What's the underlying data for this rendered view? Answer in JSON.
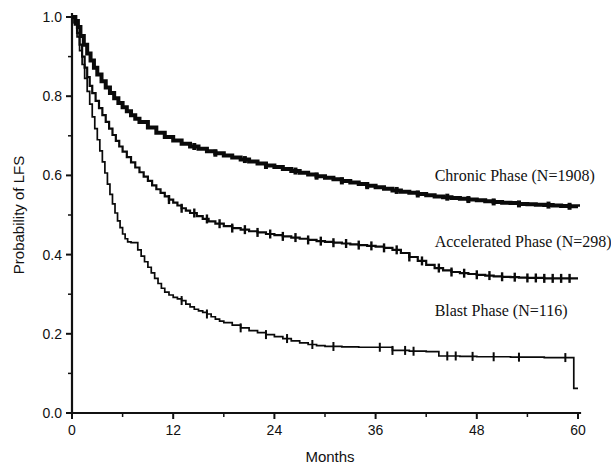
{
  "chart_data": {
    "type": "line",
    "title": "",
    "xlabel": "Months",
    "ylabel": "Probability of LFS",
    "xlim": [
      0,
      60
    ],
    "ylim": [
      0.0,
      1.0
    ],
    "grid": false,
    "legend_position": "inline-right",
    "x_ticks": [
      0,
      12,
      24,
      36,
      48,
      60
    ],
    "x_tick_labels": [
      "0",
      "12",
      "24",
      "36",
      "48",
      "60"
    ],
    "x_minor_ticks": [
      6,
      18,
      30,
      42,
      54
    ],
    "y_ticks": [
      0.0,
      0.2,
      0.4,
      0.6,
      0.8,
      1.0
    ],
    "y_tick_labels": [
      "0.0",
      "0.2",
      "0.4",
      "0.6",
      "0.8",
      "1.0"
    ],
    "y_minor_ticks": [
      0.1,
      0.3,
      0.5,
      0.7,
      0.9
    ],
    "series": [
      {
        "name": "Chronic Phase (N=1908)",
        "label": "Chronic Phase (N=1908)",
        "n": 1908,
        "color": "#0a0a0a",
        "line_width": 4.0,
        "label_x": 43.0,
        "label_y": 0.585,
        "points": [
          [
            0.0,
            1.0
          ],
          [
            0.4,
            0.99
          ],
          [
            0.7,
            0.975
          ],
          [
            1.0,
            0.952
          ],
          [
            1.4,
            0.93
          ],
          [
            1.8,
            0.908
          ],
          [
            2.2,
            0.89
          ],
          [
            2.6,
            0.872
          ],
          [
            3.0,
            0.855
          ],
          [
            3.5,
            0.838
          ],
          [
            4.0,
            0.822
          ],
          [
            4.5,
            0.808
          ],
          [
            5.0,
            0.795
          ],
          [
            5.5,
            0.783
          ],
          [
            6.0,
            0.772
          ],
          [
            6.5,
            0.762
          ],
          [
            7.0,
            0.752
          ],
          [
            7.5,
            0.743
          ],
          [
            8.0,
            0.735
          ],
          [
            9.0,
            0.721
          ],
          [
            10.0,
            0.708
          ],
          [
            11.0,
            0.697
          ],
          [
            12.0,
            0.688
          ],
          [
            13.0,
            0.68
          ],
          [
            14.0,
            0.673
          ],
          [
            15.0,
            0.667
          ],
          [
            16.0,
            0.661
          ],
          [
            17.0,
            0.656
          ],
          [
            18.0,
            0.65
          ],
          [
            19.0,
            0.645
          ],
          [
            20.0,
            0.64
          ],
          [
            21.0,
            0.635
          ],
          [
            22.0,
            0.63
          ],
          [
            23.0,
            0.625
          ],
          [
            24.0,
            0.621
          ],
          [
            25.0,
            0.616
          ],
          [
            26.0,
            0.611
          ],
          [
            27.0,
            0.607
          ],
          [
            28.0,
            0.602
          ],
          [
            29.0,
            0.598
          ],
          [
            30.0,
            0.594
          ],
          [
            31.0,
            0.59
          ],
          [
            32.0,
            0.586
          ],
          [
            33.0,
            0.582
          ],
          [
            34.0,
            0.578
          ],
          [
            35.0,
            0.574
          ],
          [
            36.0,
            0.57
          ],
          [
            37.0,
            0.566
          ],
          [
            38.0,
            0.562
          ],
          [
            39.0,
            0.559
          ],
          [
            40.0,
            0.556
          ],
          [
            41.0,
            0.553
          ],
          [
            42.0,
            0.55
          ],
          [
            43.0,
            0.547
          ],
          [
            44.0,
            0.545
          ],
          [
            45.0,
            0.543
          ],
          [
            46.0,
            0.541
          ],
          [
            47.0,
            0.539
          ],
          [
            48.0,
            0.537
          ],
          [
            49.0,
            0.535
          ],
          [
            50.0,
            0.533
          ],
          [
            51.0,
            0.531
          ],
          [
            52.0,
            0.53
          ],
          [
            53.0,
            0.528
          ],
          [
            54.0,
            0.527
          ],
          [
            55.0,
            0.526
          ],
          [
            56.0,
            0.525
          ],
          [
            57.0,
            0.524
          ],
          [
            58.0,
            0.523
          ],
          [
            59.0,
            0.522
          ],
          [
            60.0,
            0.521
          ]
        ],
        "censor_times": [
          14.5,
          17.0,
          20.5,
          23.0,
          26.5,
          29.0,
          32.0,
          35.0,
          38.5,
          41.0,
          44.5,
          47.0,
          50.0,
          53.0,
          56.5,
          59.0
        ]
      },
      {
        "name": "Accelerated Phase (N=298)",
        "label": "Accelerated Phase (N=298)",
        "n": 298,
        "color": "#0a0a0a",
        "line_width": 2.2,
        "label_x": 43.0,
        "label_y": 0.42,
        "points": [
          [
            0.0,
            1.0
          ],
          [
            0.3,
            0.985
          ],
          [
            0.6,
            0.96
          ],
          [
            0.9,
            0.93
          ],
          [
            1.2,
            0.9
          ],
          [
            1.5,
            0.872
          ],
          [
            1.8,
            0.848
          ],
          [
            2.1,
            0.826
          ],
          [
            2.4,
            0.808
          ],
          [
            2.8,
            0.788
          ],
          [
            3.2,
            0.77
          ],
          [
            3.6,
            0.752
          ],
          [
            4.0,
            0.735
          ],
          [
            4.4,
            0.718
          ],
          [
            4.8,
            0.702
          ],
          [
            5.2,
            0.687
          ],
          [
            5.6,
            0.673
          ],
          [
            6.0,
            0.66
          ],
          [
            6.5,
            0.646
          ],
          [
            7.0,
            0.633
          ],
          [
            7.5,
            0.62
          ],
          [
            8.0,
            0.608
          ],
          [
            8.5,
            0.597
          ],
          [
            9.0,
            0.586
          ],
          [
            9.5,
            0.575
          ],
          [
            10.0,
            0.565
          ],
          [
            10.5,
            0.556
          ],
          [
            11.0,
            0.547
          ],
          [
            11.5,
            0.539
          ],
          [
            12.0,
            0.531
          ],
          [
            12.5,
            0.524
          ],
          [
            13.0,
            0.517
          ],
          [
            13.5,
            0.511
          ],
          [
            14.0,
            0.505
          ],
          [
            14.8,
            0.497
          ],
          [
            15.5,
            0.49
          ],
          [
            16.2,
            0.484
          ],
          [
            17.0,
            0.478
          ],
          [
            18.0,
            0.472
          ],
          [
            19.0,
            0.467
          ],
          [
            20.0,
            0.463
          ],
          [
            21.0,
            0.459
          ],
          [
            22.0,
            0.456
          ],
          [
            23.0,
            0.452
          ],
          [
            24.0,
            0.449
          ],
          [
            25.0,
            0.446
          ],
          [
            26.0,
            0.443
          ],
          [
            27.0,
            0.44
          ],
          [
            28.0,
            0.437
          ],
          [
            29.0,
            0.434
          ],
          [
            30.0,
            0.432
          ],
          [
            31.0,
            0.43
          ],
          [
            32.0,
            0.428
          ],
          [
            33.0,
            0.426
          ],
          [
            34.0,
            0.424
          ],
          [
            35.0,
            0.422
          ],
          [
            36.0,
            0.42
          ],
          [
            37.0,
            0.417
          ],
          [
            38.0,
            0.412
          ],
          [
            39.0,
            0.404
          ],
          [
            40.0,
            0.394
          ],
          [
            41.0,
            0.384
          ],
          [
            42.0,
            0.374
          ],
          [
            43.0,
            0.366
          ],
          [
            44.0,
            0.36
          ],
          [
            45.0,
            0.356
          ],
          [
            46.0,
            0.353
          ],
          [
            47.0,
            0.351
          ],
          [
            48.0,
            0.349
          ],
          [
            49.0,
            0.347
          ],
          [
            50.0,
            0.345
          ],
          [
            51.0,
            0.344
          ],
          [
            52.0,
            0.343
          ],
          [
            53.0,
            0.342
          ],
          [
            54.0,
            0.341
          ],
          [
            55.0,
            0.341
          ],
          [
            56.0,
            0.34
          ],
          [
            57.0,
            0.34
          ],
          [
            58.0,
            0.34
          ],
          [
            59.0,
            0.34
          ],
          [
            60.0,
            0.34
          ]
        ],
        "censor_times": [
          11.5,
          13.0,
          14.5,
          16.0,
          17.5,
          19.0,
          20.5,
          22.0,
          23.5,
          25.0,
          26.5,
          28.0,
          29.5,
          31.0,
          32.5,
          34.0,
          35.5,
          37.0,
          38.5,
          40.0,
          41.5,
          43.5,
          45.0,
          46.5,
          48.0,
          49.5,
          51.0,
          52.5,
          54.0,
          55.0,
          56.0,
          57.0,
          58.0,
          59.0
        ]
      },
      {
        "name": "Blast Phase (N=116)",
        "label": "Blast Phase (N=116)",
        "n": 116,
        "color": "#0a0a0a",
        "line_width": 1.7,
        "label_x": 43.0,
        "label_y": 0.245,
        "points": [
          [
            0.0,
            1.0
          ],
          [
            0.3,
            0.98
          ],
          [
            0.6,
            0.95
          ],
          [
            0.9,
            0.915
          ],
          [
            1.2,
            0.88
          ],
          [
            1.5,
            0.845
          ],
          [
            1.8,
            0.812
          ],
          [
            2.1,
            0.78
          ],
          [
            2.4,
            0.748
          ],
          [
            2.7,
            0.718
          ],
          [
            3.0,
            0.69
          ],
          [
            3.3,
            0.662
          ],
          [
            3.6,
            0.634
          ],
          [
            3.9,
            0.606
          ],
          [
            4.2,
            0.578
          ],
          [
            4.5,
            0.552
          ],
          [
            4.8,
            0.528
          ],
          [
            5.1,
            0.505
          ],
          [
            5.4,
            0.485
          ],
          [
            5.7,
            0.468
          ],
          [
            6.0,
            0.452
          ],
          [
            6.3,
            0.44
          ],
          [
            6.6,
            0.432
          ],
          [
            7.0,
            0.43
          ],
          [
            7.4,
            0.43
          ],
          [
            7.8,
            0.412
          ],
          [
            8.2,
            0.396
          ],
          [
            8.6,
            0.382
          ],
          [
            9.0,
            0.368
          ],
          [
            9.4,
            0.354
          ],
          [
            9.8,
            0.34
          ],
          [
            10.2,
            0.327
          ],
          [
            10.6,
            0.315
          ],
          [
            11.0,
            0.305
          ],
          [
            11.5,
            0.298
          ],
          [
            12.0,
            0.292
          ],
          [
            12.5,
            0.288
          ],
          [
            13.0,
            0.284
          ],
          [
            13.5,
            0.275
          ],
          [
            14.0,
            0.268
          ],
          [
            14.5,
            0.262
          ],
          [
            15.0,
            0.258
          ],
          [
            15.5,
            0.254
          ],
          [
            16.0,
            0.25
          ],
          [
            16.5,
            0.243
          ],
          [
            17.0,
            0.237
          ],
          [
            17.5,
            0.232
          ],
          [
            18.0,
            0.228
          ],
          [
            19.0,
            0.222
          ],
          [
            20.0,
            0.215
          ],
          [
            21.0,
            0.208
          ],
          [
            22.0,
            0.203
          ],
          [
            23.0,
            0.198
          ],
          [
            24.0,
            0.193
          ],
          [
            25.0,
            0.188
          ],
          [
            26.0,
            0.182
          ],
          [
            27.0,
            0.177
          ],
          [
            28.0,
            0.173
          ],
          [
            29.0,
            0.17
          ],
          [
            30.0,
            0.168
          ],
          [
            32.0,
            0.167
          ],
          [
            34.0,
            0.166
          ],
          [
            36.0,
            0.166
          ],
          [
            38.0,
            0.158
          ],
          [
            40.0,
            0.156
          ],
          [
            42.0,
            0.155
          ],
          [
            43.0,
            0.155
          ],
          [
            43.5,
            0.144
          ],
          [
            46.0,
            0.143
          ],
          [
            48.0,
            0.142
          ],
          [
            50.0,
            0.142
          ],
          [
            52.0,
            0.141
          ],
          [
            54.0,
            0.141
          ],
          [
            56.0,
            0.14
          ],
          [
            58.0,
            0.14
          ],
          [
            59.4,
            0.14
          ],
          [
            59.5,
            0.062
          ],
          [
            60.0,
            0.062
          ]
        ],
        "censor_times": [
          13.0,
          16.0,
          20.0,
          23.0,
          25.5,
          28.5,
          31.0,
          36.5,
          38.0,
          39.5,
          40.5,
          44.5,
          45.5,
          47.5,
          50.0,
          53.0,
          58.5
        ]
      }
    ]
  }
}
